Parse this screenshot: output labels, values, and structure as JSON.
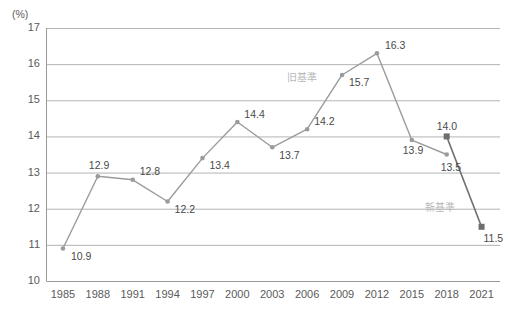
{
  "chart_data": {
    "type": "line",
    "title": "",
    "xlabel": "",
    "ylabel": "(%)",
    "ylim": [
      10,
      17
    ],
    "ytick_step": 1,
    "grid": true,
    "legend_position": "inline-annotation",
    "categories": [
      "1985",
      "1988",
      "1991",
      "1994",
      "1997",
      "2000",
      "2003",
      "2006",
      "2009",
      "2012",
      "2015",
      "2018",
      "2021"
    ],
    "yticks": [
      "10",
      "11",
      "12",
      "13",
      "14",
      "15",
      "16",
      "17"
    ],
    "series": [
      {
        "name": "旧基準",
        "color": "#9b9b9b",
        "marker": "circle",
        "x": [
          "1985",
          "1988",
          "1991",
          "1994",
          "1997",
          "2000",
          "2003",
          "2006",
          "2009",
          "2012",
          "2015",
          "2018"
        ],
        "values": [
          10.9,
          12.9,
          12.8,
          12.2,
          13.4,
          14.4,
          13.7,
          14.2,
          15.7,
          16.3,
          13.9,
          13.5
        ],
        "labels": [
          "10.9",
          "12.9",
          "12.8",
          "12.2",
          "13.4",
          "14.4",
          "13.7",
          "14.2",
          "15.7",
          "16.3",
          "13.9",
          "13.5"
        ]
      },
      {
        "name": "新基準",
        "color": "#6e6e6e",
        "marker": "square",
        "x": [
          "2018",
          "2021"
        ],
        "values": [
          14.0,
          11.5
        ],
        "labels": [
          "14.0",
          "11.5"
        ]
      }
    ],
    "annotations": [
      {
        "text": "旧基準",
        "series": "旧基準"
      },
      {
        "text": "新基準",
        "series": "新基準"
      }
    ]
  },
  "axis": {
    "unit": "(%)"
  },
  "colors": {
    "old_standard_line": "#9b9b9b",
    "new_standard_line": "#6e6e6e",
    "grid": "#b3b3b3",
    "axis": "#9a9a9a",
    "text": "#4a4a4a",
    "annotation": "#b9b9b9"
  }
}
